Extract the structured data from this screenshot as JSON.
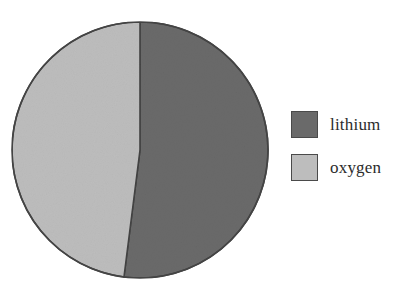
{
  "chart_data": {
    "type": "pie",
    "title": "",
    "categories": [
      "lithium",
      "oxygen"
    ],
    "values": [
      52,
      48
    ],
    "unit": "percent",
    "start_angle_deg": 0,
    "direction": "clockwise",
    "slices": [
      {
        "label": "lithium",
        "value": 52,
        "color": "#6a6a6a",
        "start_angle_deg": 0,
        "end_angle_deg": 187.2
      },
      {
        "label": "oxygen",
        "value": 48,
        "color": "#bdbdbd",
        "start_angle_deg": 187.2,
        "end_angle_deg": 360
      }
    ],
    "legend": {
      "position": "right",
      "entries": [
        {
          "label": "lithium",
          "color": "#6a6a6a"
        },
        {
          "label": "oxygen",
          "color": "#bdbdbd"
        }
      ]
    },
    "geometry": {
      "center_x": 140,
      "center_y": 150,
      "radius": 128
    },
    "style": {
      "background": "#ffffff",
      "outline_color": "#444444",
      "outline_width": 1.6,
      "grid": false
    },
    "xlabel": "",
    "ylabel": ""
  }
}
